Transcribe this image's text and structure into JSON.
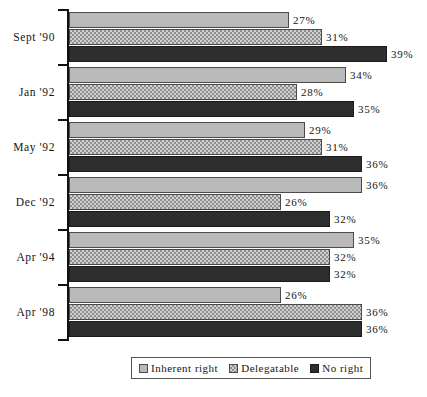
{
  "chart_data": {
    "type": "bar",
    "orientation": "horizontal",
    "title": "",
    "xlabel": "",
    "ylabel": "",
    "grid": false,
    "legend_position": "bottom-center",
    "axis_range": [
      0,
      40
    ],
    "value_suffix": "%",
    "categories": [
      "Sept '90",
      "Jan '92",
      "May '92",
      "Dec '92",
      "Apr '94",
      "Apr '98"
    ],
    "series": [
      {
        "name": "Inherent right",
        "swatch": "light-gray-solid",
        "color": "#b9b9b9",
        "values": [
          27,
          34,
          29,
          36,
          35,
          26
        ],
        "labels": [
          "27%",
          "34%",
          "29%",
          "36%",
          "35%",
          "26%"
        ]
      },
      {
        "name": "Delegatable",
        "swatch": "gray-hatched",
        "color": "#cfcfcf",
        "values": [
          31,
          28,
          31,
          26,
          32,
          36
        ],
        "labels": [
          "31%",
          "28%",
          "31%",
          "26%",
          "32%",
          "36%"
        ]
      },
      {
        "name": "No right",
        "swatch": "black-solid",
        "color": "#2e2e2e",
        "values": [
          39,
          35,
          36,
          32,
          32,
          36
        ],
        "labels": [
          "39%",
          "35%",
          "36%",
          "32%",
          "32%",
          "36%"
        ]
      }
    ]
  },
  "legend": {
    "items": [
      {
        "label": "Inherent right"
      },
      {
        "label": "Delegatable"
      },
      {
        "label": "No right"
      }
    ]
  }
}
